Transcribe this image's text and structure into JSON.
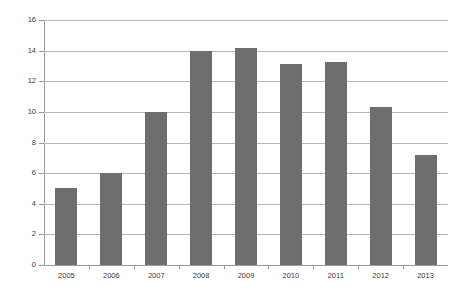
{
  "chart_data": {
    "type": "bar",
    "title": "",
    "subtitle": "",
    "xlabel": "",
    "ylabel": "",
    "categories": [
      "2005",
      "2006",
      "2007",
      "2008",
      "2009",
      "2010",
      "2011",
      "2012",
      "2013"
    ],
    "values": [
      5,
      6,
      10,
      14,
      14.2,
      13.1,
      13.25,
      10.3,
      7.2
    ],
    "series": [
      {
        "name": "",
        "values": [
          5,
          6,
          10,
          14,
          14.2,
          13.1,
          13.25,
          10.3,
          7.2
        ]
      }
    ],
    "ylim": [
      0,
      16
    ],
    "ytick_step": 2,
    "yticks": [
      "0",
      "2",
      "4",
      "6",
      "8",
      "10",
      "12",
      "14",
      "16"
    ],
    "grid": true,
    "grid_axis": "y",
    "legend": false,
    "legend_position": "none",
    "bar_color": "#6e6e6e",
    "gridline_color": "#b8b8b8",
    "axis_color": "#9a9a9a",
    "label_color": "#3a3a3a",
    "background_color": "#ffffff"
  }
}
